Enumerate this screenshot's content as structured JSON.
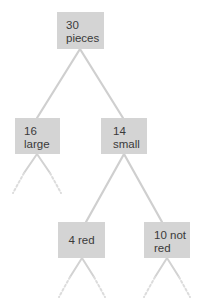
{
  "diagram": {
    "type": "tree",
    "colors": {
      "node_fill": "#d4d4d4",
      "edge": "#cfcfcf",
      "text": "#3a3a3a"
    },
    "nodes": {
      "root": {
        "line1": "30",
        "line2": "pieces"
      },
      "large": {
        "line1": "16",
        "line2": "large"
      },
      "small": {
        "line1": "14",
        "line2": "small"
      },
      "red": {
        "label": "4 red"
      },
      "not_red": {
        "line1": "10 not",
        "line2": "red"
      }
    },
    "edges": [
      {
        "from": "root",
        "to": "large"
      },
      {
        "from": "root",
        "to": "small"
      },
      {
        "from": "small",
        "to": "red"
      },
      {
        "from": "small",
        "to": "not_red"
      },
      {
        "from": "large",
        "to": "continued-left",
        "style": "dashed"
      },
      {
        "from": "large",
        "to": "continued-right",
        "style": "dashed"
      },
      {
        "from": "red",
        "to": "continued-left",
        "style": "dashed"
      },
      {
        "from": "red",
        "to": "continued-right",
        "style": "dashed"
      },
      {
        "from": "not_red",
        "to": "continued-left",
        "style": "dashed"
      },
      {
        "from": "not_red",
        "to": "continued-right",
        "style": "dashed"
      }
    ]
  }
}
